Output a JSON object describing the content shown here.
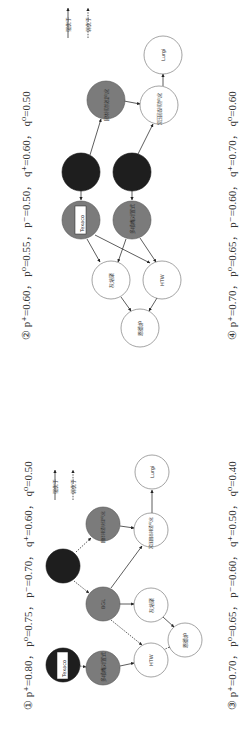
{
  "colors": {
    "strong_node": "#1e1e1e",
    "medium_node": "#7b7b7b",
    "weak_node": "#ffffff",
    "edge": "#333333"
  },
  "legend": {
    "strong": "强优于",
    "weak": "弱优于"
  },
  "diagrams": [
    {
      "id": "1",
      "caption": "① p⁺=0.80， p⁰=0.75， p⁻=0.70， q⁺=0.60， q⁰=0.50",
      "nodes": {
        "texaco": "Texaco",
        "dark_b": "",
        "multi_nozzle": "多喷嘴对置式",
        "bgl": "BGL",
        "slag_top": "固体排渣块煤气化",
        "htw": "HTW",
        "ash_agglom": "灰熔聚",
        "pressure_slag": "常压固态排渣气化",
        "ende": "恩德炉",
        "lurgi": "Lurgi"
      }
    },
    {
      "id": "2",
      "caption": "② p⁺=0.60， p⁰=0.55， p⁻=0.50， q⁺=0.60， q⁰=0.50",
      "nodes": {
        "dark_a": "",
        "dark_b": "",
        "texaco": "Texaco",
        "multi_nozzle": "多喷嘴对置式",
        "slag_top": "固体排渣块煤气化",
        "pressure_slag": "常压固态排渣气化",
        "ash_agglom": "灰熔聚",
        "htw": "HTW",
        "ende": "恩德炉",
        "lurgi": "Lurgi"
      }
    },
    {
      "id": "3",
      "caption": "③ p⁺=0.70， p⁰=0.65， p⁻=0.60， q⁺=0.50， q⁰=0.40"
    },
    {
      "id": "4",
      "caption": "④ p⁺=0.70， p⁰=0.65， p⁻=0.60， q⁺=0.70， q⁰=0.60"
    }
  ]
}
